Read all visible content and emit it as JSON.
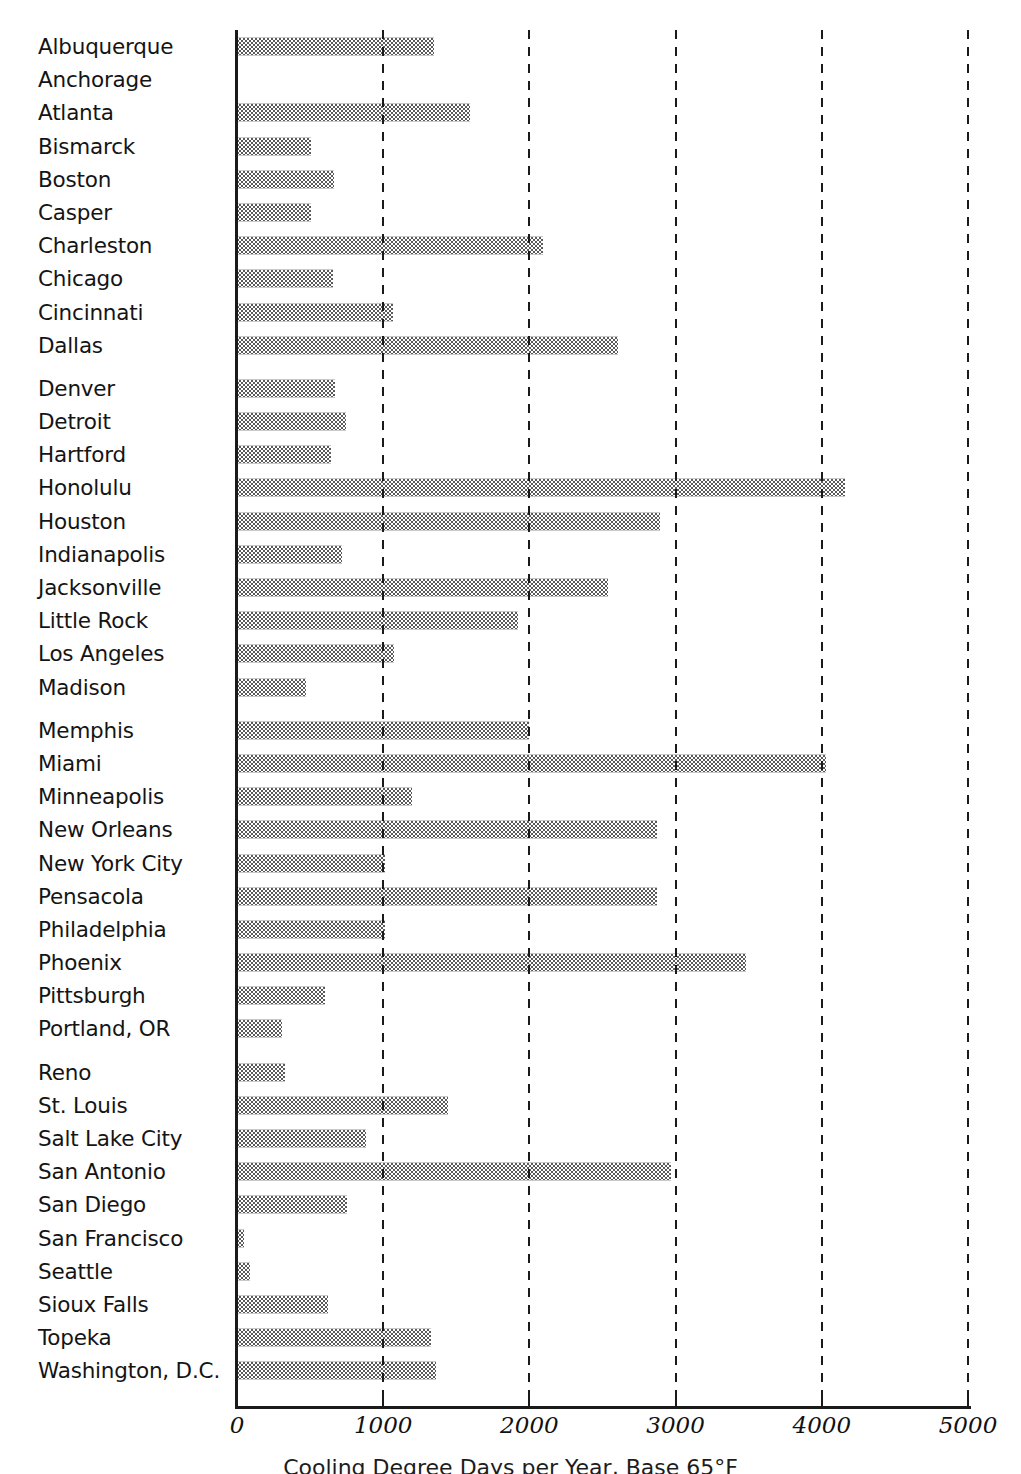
{
  "chart_data": {
    "type": "bar",
    "orientation": "horizontal",
    "title": "",
    "xlabel": "Cooling Degree Days per Year, Base 65°F",
    "ylabel": "",
    "xlim": [
      0,
      5000
    ],
    "xticks": [
      0,
      1000,
      2000,
      3000,
      4000,
      5000
    ],
    "xtick_labels": [
      "0",
      "1000",
      "2000",
      "3000",
      "4000",
      "5000"
    ],
    "grid": "vertical-dashed",
    "legend": "none",
    "bar_fill": "checkered-gray-dither",
    "bar_fill_color": "#5a5a5a",
    "axis_color": "#1a1a1a",
    "groups": [
      [
        "Albuquerque",
        "Anchorage",
        "Atlanta",
        "Bismarck",
        "Boston",
        "Casper",
        "Charleston",
        "Chicago",
        "Cincinnati",
        "Dallas"
      ],
      [
        "Denver",
        "Detroit",
        "Hartford",
        "Honolulu",
        "Houston",
        "Indianapolis",
        "Jacksonville",
        "Little Rock",
        "Los Angeles",
        "Madison"
      ],
      [
        "Memphis",
        "Miami",
        "Minneapolis",
        "New Orleans",
        "New York City",
        "Pensacola",
        "Philadelphia",
        "Phoenix",
        "Pittsburgh",
        "Portland, OR"
      ],
      [
        "Reno",
        "St. Louis",
        "Salt Lake City",
        "San Antonio",
        "San Diego",
        "San Francisco",
        "Seattle",
        "Sioux Falls",
        "Topeka",
        "Washington, D.C."
      ]
    ],
    "categories": [
      "Albuquerque",
      "Anchorage",
      "Atlanta",
      "Bismarck",
      "Boston",
      "Casper",
      "Charleston",
      "Chicago",
      "Cincinnati",
      "Dallas",
      "Denver",
      "Detroit",
      "Hartford",
      "Honolulu",
      "Houston",
      "Indianapolis",
      "Jacksonville",
      "Little Rock",
      "Los Angeles",
      "Madison",
      "Memphis",
      "Miami",
      "Minneapolis",
      "New Orleans",
      "New York City",
      "Pensacola",
      "Philadelphia",
      "Phoenix",
      "Pittsburgh",
      "Portland, OR",
      "Reno",
      "St. Louis",
      "Salt Lake City",
      "San Antonio",
      "San Diego",
      "San Francisco",
      "Seattle",
      "Sioux Falls",
      "Topeka",
      "Washington, D.C."
    ],
    "values": [
      1345,
      0,
      1590,
      505,
      660,
      505,
      2090,
      655,
      1070,
      2605,
      670,
      745,
      640,
      4160,
      2890,
      720,
      2540,
      1920,
      1075,
      470,
      2000,
      4030,
      1200,
      2870,
      1010,
      2870,
      1015,
      3480,
      600,
      310,
      330,
      1440,
      880,
      2965,
      755,
      45,
      90,
      625,
      1325,
      1360
    ],
    "data": [
      {
        "city": "Albuquerque",
        "value": 1345
      },
      {
        "city": "Anchorage",
        "value": 0
      },
      {
        "city": "Atlanta",
        "value": 1590
      },
      {
        "city": "Bismarck",
        "value": 505
      },
      {
        "city": "Boston",
        "value": 660
      },
      {
        "city": "Casper",
        "value": 505
      },
      {
        "city": "Charleston",
        "value": 2090
      },
      {
        "city": "Chicago",
        "value": 655
      },
      {
        "city": "Cincinnati",
        "value": 1070
      },
      {
        "city": "Dallas",
        "value": 2605
      },
      {
        "city": "Denver",
        "value": 670
      },
      {
        "city": "Detroit",
        "value": 745
      },
      {
        "city": "Hartford",
        "value": 640
      },
      {
        "city": "Honolulu",
        "value": 4160
      },
      {
        "city": "Houston",
        "value": 2890
      },
      {
        "city": "Indianapolis",
        "value": 720
      },
      {
        "city": "Jacksonville",
        "value": 2540
      },
      {
        "city": "Little Rock",
        "value": 1920
      },
      {
        "city": "Los Angeles",
        "value": 1075
      },
      {
        "city": "Madison",
        "value": 470
      },
      {
        "city": "Memphis",
        "value": 2000
      },
      {
        "city": "Miami",
        "value": 4030
      },
      {
        "city": "Minneapolis",
        "value": 1200
      },
      {
        "city": "New Orleans",
        "value": 2870
      },
      {
        "city": "New York City",
        "value": 1010
      },
      {
        "city": "Pensacola",
        "value": 2870
      },
      {
        "city": "Philadelphia",
        "value": 1015
      },
      {
        "city": "Phoenix",
        "value": 3480
      },
      {
        "city": "Pittsburgh",
        "value": 600
      },
      {
        "city": "Portland, OR",
        "value": 310
      },
      {
        "city": "Reno",
        "value": 330
      },
      {
        "city": "St. Louis",
        "value": 1440
      },
      {
        "city": "Salt Lake City",
        "value": 880
      },
      {
        "city": "San Antonio",
        "value": 2965
      },
      {
        "city": "San Diego",
        "value": 755
      },
      {
        "city": "San Francisco",
        "value": 45
      },
      {
        "city": "Seattle",
        "value": 90
      },
      {
        "city": "Sioux Falls",
        "value": 625
      },
      {
        "city": "Topeka",
        "value": 1325
      },
      {
        "city": "Washington, D.C.",
        "value": 1360
      }
    ]
  }
}
